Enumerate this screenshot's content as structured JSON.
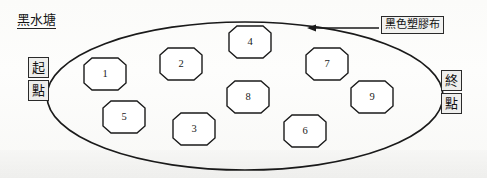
{
  "diagram": {
    "title": "黑水塘",
    "pond": {
      "shape": "ellipse",
      "label": "黑水塘",
      "cx": 245,
      "cy": 96,
      "rx": 198,
      "ry": 74
    },
    "callout": {
      "text": "黑色塑膠布",
      "arrow": {
        "from_x": 378,
        "from_y": 28,
        "to_x": 310,
        "to_y": 28,
        "direction": "left"
      }
    },
    "start_marker": {
      "chars": [
        "起",
        "點"
      ],
      "meaning": "start-point",
      "side": "left"
    },
    "end_marker": {
      "chars": [
        "終",
        "點"
      ],
      "meaning": "end-point",
      "side": "right"
    },
    "cells": [
      {
        "id": "1",
        "label": "1",
        "cx": 105,
        "cy": 74,
        "w": 60,
        "h": 32
      },
      {
        "id": "2",
        "label": "2",
        "cx": 181,
        "cy": 64,
        "w": 60,
        "h": 32
      },
      {
        "id": "3",
        "label": "3",
        "cx": 194,
        "cy": 129,
        "w": 60,
        "h": 32
      },
      {
        "id": "4",
        "label": "4",
        "cx": 250,
        "cy": 42,
        "w": 60,
        "h": 32
      },
      {
        "id": "5",
        "label": "5",
        "cx": 124,
        "cy": 117,
        "w": 60,
        "h": 32
      },
      {
        "id": "6",
        "label": "6",
        "cx": 305,
        "cy": 131,
        "w": 60,
        "h": 32
      },
      {
        "id": "7",
        "label": "7",
        "cx": 327,
        "cy": 64,
        "w": 60,
        "h": 32
      },
      {
        "id": "8",
        "label": "8",
        "cx": 248,
        "cy": 97,
        "w": 60,
        "h": 32
      },
      {
        "id": "9",
        "label": "9",
        "cx": 372,
        "cy": 97,
        "w": 60,
        "h": 32
      }
    ]
  },
  "colors": {
    "ink": "#1a1a1a",
    "paper": "#fdfdfb",
    "box_fill": "#eeeeec"
  }
}
